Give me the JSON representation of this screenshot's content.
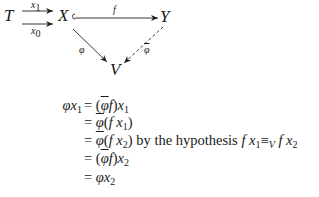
{
  "diagram": {
    "nodes": {
      "T": "T",
      "X": "X",
      "Y": "Y",
      "V": "V"
    },
    "arrows": {
      "x1": {
        "label": "x",
        "sub": "1",
        "from": "T",
        "to": "X"
      },
      "x0": {
        "label": "x",
        "sub": "0",
        "from": "T",
        "to": "X"
      },
      "f": {
        "label": "f",
        "from": "X",
        "to": "Y",
        "style": "mono"
      },
      "phi": {
        "label": "φ",
        "from": "X",
        "to": "V"
      },
      "phibar": {
        "label": "φ",
        "overline": true,
        "from": "Y",
        "to": "V",
        "style": "dashed"
      }
    }
  },
  "equations": {
    "lhs": {
      "sym": "φ",
      "var": "x",
      "sub": "1"
    },
    "lines": [
      {
        "eq": "=",
        "parts": [
          "(",
          "φ",
          "f",
          ")",
          "x",
          "1"
        ]
      },
      {
        "eq": "=",
        "parts": [
          "φ",
          "(",
          "f",
          "x",
          "1",
          ")"
        ]
      },
      {
        "eq": "=",
        "parts": [
          "φ",
          "(",
          "f",
          "x",
          "2",
          ")"
        ],
        "note": "by the hypothesis",
        "hyp": {
          "f1": "f",
          "x1": "x",
          "s1": "1",
          "rel": "≡",
          "relsub": "V",
          "f2": "f",
          "x2": "x",
          "s2": "2"
        }
      },
      {
        "eq": "=",
        "parts": [
          "(",
          "φ",
          "f",
          ")",
          "x",
          "2"
        ]
      },
      {
        "eq": "=",
        "parts": [
          "φ",
          "x",
          "2"
        ]
      }
    ]
  }
}
